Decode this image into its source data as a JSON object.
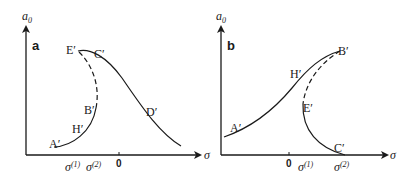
{
  "panels": [
    {
      "id": "a",
      "label": "a",
      "y_axis_label": "a",
      "y_axis_sub": "0",
      "x_axis_label": "σ",
      "zero_tick": "0",
      "sigma1": "σ",
      "sigma1_sup": "(1)",
      "sigma2": "σ",
      "sigma2_sup": "(2)",
      "points": {
        "A": "A′",
        "H": "H′",
        "B": "B′",
        "E": "E′",
        "C": "C′",
        "D": "D′"
      },
      "segments": [
        {
          "from": "A′",
          "to": "B′",
          "style": "solid"
        },
        {
          "from": "B′",
          "to": "E′",
          "style": "dashed"
        },
        {
          "from": "E′",
          "to": "D′",
          "style": "solid"
        }
      ]
    },
    {
      "id": "b",
      "label": "b",
      "y_axis_label": "a",
      "y_axis_sub": "0",
      "x_axis_label": "σ",
      "zero_tick": "0",
      "sigma1": "σ",
      "sigma1_sup": "(1)",
      "sigma2": "σ",
      "sigma2_sup": "(2)",
      "points": {
        "A": "A′",
        "H": "H′",
        "B": "B′",
        "E": "E′",
        "C": "C′"
      },
      "segments": [
        {
          "from": "A′",
          "to": "B′",
          "style": "solid"
        },
        {
          "from": "B′",
          "to": "E′",
          "style": "dashed"
        },
        {
          "from": "E′",
          "to": "C′",
          "style": "solid"
        }
      ]
    }
  ],
  "colors": {
    "ink": "#1a1a1a",
    "background": "#ffffff"
  }
}
